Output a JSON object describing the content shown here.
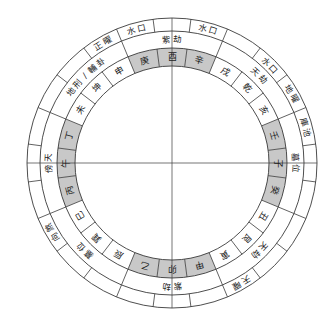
{
  "diagram": {
    "title": "",
    "center": [
      172,
      163
    ],
    "radii": {
      "outer": 145,
      "outer_band_inner": 132,
      "mid_band_inner": 115,
      "mountain_inner": 97
    },
    "colors": {
      "line": "#3a3a3a",
      "shade": "#c8c8c8",
      "text": "#222222",
      "background": "#ffffff"
    },
    "sector_degrees": 15,
    "mountains_clockwise_from_top": [
      {
        "name": "酉",
        "shaded": true
      },
      {
        "name": "辛",
        "shaded": true
      },
      {
        "name": "戌",
        "shaded": false
      },
      {
        "name": "乾",
        "shaded": false
      },
      {
        "name": "亥",
        "shaded": false
      },
      {
        "name": "壬",
        "shaded": true
      },
      {
        "name": "子",
        "shaded": true
      },
      {
        "name": "癸",
        "shaded": true
      },
      {
        "name": "丑",
        "shaded": false
      },
      {
        "name": "艮",
        "shaded": false
      },
      {
        "name": "寅",
        "shaded": false
      },
      {
        "name": "甲",
        "shaded": true
      },
      {
        "name": "卯",
        "shaded": true
      },
      {
        "name": "乙",
        "shaded": true
      },
      {
        "name": "辰",
        "shaded": false
      },
      {
        "name": "巽",
        "shaded": false
      },
      {
        "name": "巳",
        "shaded": false
      },
      {
        "name": "丙",
        "shaded": true
      },
      {
        "name": "午",
        "shaded": true
      },
      {
        "name": "丁",
        "shaded": true
      },
      {
        "name": "未",
        "shaded": false
      },
      {
        "name": "坤",
        "shaded": false
      },
      {
        "name": "申",
        "shaded": false
      },
      {
        "name": "庚",
        "shaded": true
      }
    ],
    "mid_band_labels": [
      {
        "text": "紫劫",
        "angle": 0
      },
      {
        "text": "天劫",
        "angle": 45
      },
      {
        "text": "墓位",
        "angle": 90
      },
      {
        "text": "天劫",
        "angle": 135
      },
      {
        "text": "紫劫",
        "angle": 180
      },
      {
        "text": "墓位",
        "angle": 225
      },
      {
        "text": "傍天",
        "angle": 270
      },
      {
        "text": "地刑/輔卦",
        "angle": 315
      }
    ],
    "outer_band_labels": [
      {
        "text": "水口",
        "angle": -15
      },
      {
        "text": "水口",
        "angle": 15
      },
      {
        "text": "水口",
        "angle": 45
      },
      {
        "text": "地曜",
        "angle": 60
      },
      {
        "text": "庫池",
        "angle": 75
      },
      {
        "text": "天曜",
        "angle": 150
      },
      {
        "text": "向煞",
        "angle": 240
      },
      {
        "text": "正曜",
        "angle": 330
      }
    ],
    "axes": {
      "horizontal": true,
      "vertical": true
    }
  }
}
